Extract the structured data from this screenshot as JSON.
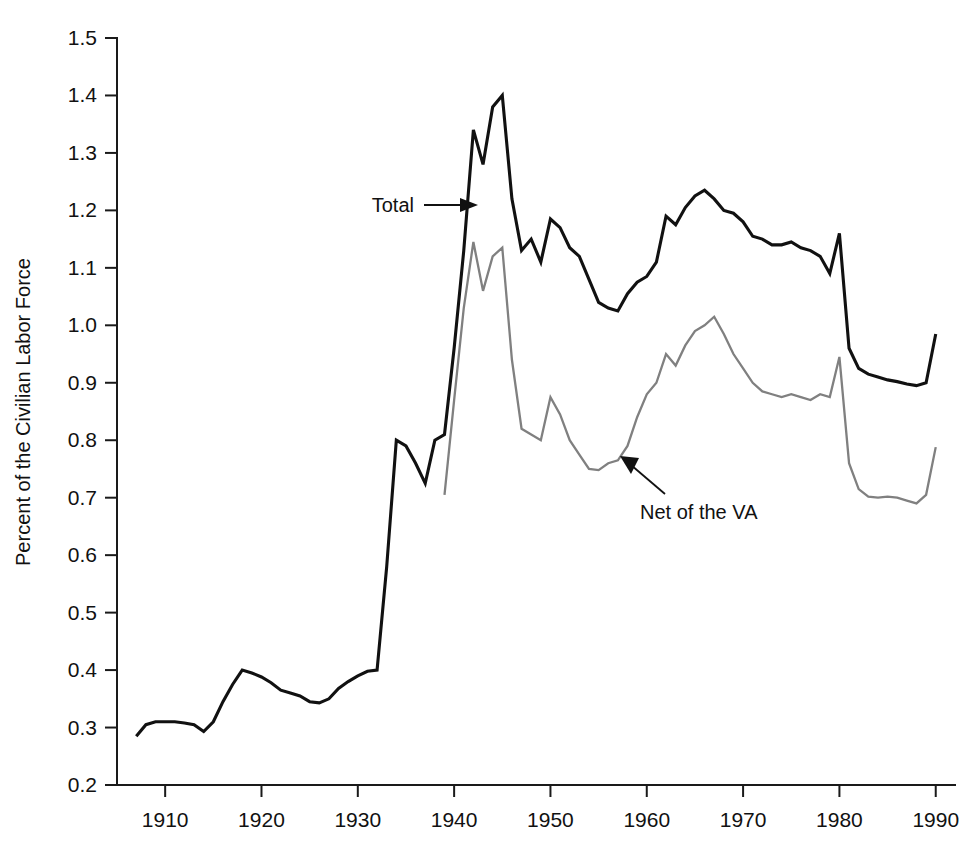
{
  "chart_data": {
    "type": "line",
    "title": "",
    "subtitle": "",
    "xlabel": "",
    "ylabel": "Percent of the Civilian Labor Force",
    "xlim": [
      1905,
      1992
    ],
    "ylim": [
      0.2,
      1.5
    ],
    "grid": false,
    "legend_position": "inline-annotations",
    "x_ticks": [
      1910,
      1920,
      1930,
      1940,
      1950,
      1960,
      1970,
      1980,
      1990
    ],
    "x_tick_labels": [
      "1910",
      "1920",
      "1930",
      "1940",
      "1950",
      "1960",
      "1970",
      "1980",
      "1990"
    ],
    "y_ticks": [
      0.2,
      0.3,
      0.4,
      0.5,
      0.6,
      0.7,
      0.8,
      0.9,
      1.0,
      1.1,
      1.2,
      1.3,
      1.4,
      1.5
    ],
    "y_tick_labels": [
      "0.2",
      "0.3",
      "0.4",
      "0.5",
      "0.6",
      "0.7",
      "0.8",
      "0.9",
      "1.0",
      "1.1",
      "1.2",
      "1.3",
      "1.4",
      "1.5"
    ],
    "annotations": [
      {
        "text": "Total",
        "points_to_series": "Total",
        "arrow": "right"
      },
      {
        "text": "Net of the VA",
        "points_to_series": "Net of the VA",
        "arrow": "up-left"
      }
    ],
    "series": [
      {
        "name": "Total",
        "color": "#111111",
        "x": [
          1907,
          1908,
          1909,
          1910,
          1911,
          1912,
          1913,
          1914,
          1915,
          1916,
          1917,
          1918,
          1919,
          1920,
          1921,
          1922,
          1923,
          1924,
          1925,
          1926,
          1927,
          1928,
          1929,
          1930,
          1931,
          1932,
          1933,
          1934,
          1935,
          1936,
          1937,
          1938,
          1939,
          1940,
          1941,
          1942,
          1943,
          1944,
          1945,
          1946,
          1947,
          1948,
          1949,
          1950,
          1951,
          1952,
          1953,
          1954,
          1955,
          1956,
          1957,
          1958,
          1959,
          1960,
          1961,
          1962,
          1963,
          1964,
          1965,
          1966,
          1967,
          1968,
          1969,
          1970,
          1971,
          1972,
          1973,
          1974,
          1975,
          1976,
          1977,
          1978,
          1979,
          1980,
          1981,
          1982,
          1983,
          1984,
          1985,
          1986,
          1987,
          1988,
          1989,
          1990
        ],
        "values": [
          0.285,
          0.305,
          0.31,
          0.31,
          0.31,
          0.308,
          0.305,
          0.293,
          0.31,
          0.345,
          0.375,
          0.4,
          0.395,
          0.388,
          0.378,
          0.365,
          0.36,
          0.355,
          0.345,
          0.343,
          0.35,
          0.368,
          0.38,
          0.39,
          0.398,
          0.4,
          0.58,
          0.8,
          0.79,
          0.76,
          0.725,
          0.8,
          0.81,
          0.96,
          1.13,
          1.34,
          1.28,
          1.38,
          1.4,
          1.22,
          1.13,
          1.15,
          1.11,
          1.185,
          1.17,
          1.135,
          1.12,
          1.08,
          1.04,
          1.03,
          1.025,
          1.055,
          1.075,
          1.085,
          1.11,
          1.19,
          1.175,
          1.205,
          1.225,
          1.235,
          1.22,
          1.2,
          1.195,
          1.18,
          1.155,
          1.15,
          1.14,
          1.14,
          1.145,
          1.135,
          1.13,
          1.12,
          1.09,
          1.16,
          0.96,
          0.925,
          0.915,
          0.91,
          0.905,
          0.902,
          0.898,
          0.895,
          0.9,
          0.985
        ]
      },
      {
        "name": "Net of the VA",
        "color": "#808080",
        "x": [
          1939,
          1940,
          1941,
          1942,
          1943,
          1944,
          1945,
          1946,
          1947,
          1948,
          1949,
          1950,
          1951,
          1952,
          1953,
          1954,
          1955,
          1956,
          1957,
          1958,
          1959,
          1960,
          1961,
          1962,
          1963,
          1964,
          1965,
          1966,
          1967,
          1968,
          1969,
          1970,
          1971,
          1972,
          1973,
          1974,
          1975,
          1976,
          1977,
          1978,
          1979,
          1980,
          1981,
          1982,
          1983,
          1984,
          1985,
          1986,
          1987,
          1988,
          1989,
          1990
        ],
        "values": [
          0.705,
          0.87,
          1.03,
          1.145,
          1.06,
          1.12,
          1.135,
          0.94,
          0.82,
          0.81,
          0.8,
          0.875,
          0.845,
          0.8,
          0.775,
          0.75,
          0.748,
          0.76,
          0.765,
          0.79,
          0.84,
          0.88,
          0.9,
          0.95,
          0.93,
          0.965,
          0.99,
          1.0,
          1.015,
          0.985,
          0.95,
          0.925,
          0.9,
          0.885,
          0.88,
          0.875,
          0.88,
          0.875,
          0.87,
          0.88,
          0.875,
          0.945,
          0.76,
          0.715,
          0.702,
          0.7,
          0.702,
          0.7,
          0.695,
          0.69,
          0.705,
          0.788
        ]
      }
    ]
  }
}
